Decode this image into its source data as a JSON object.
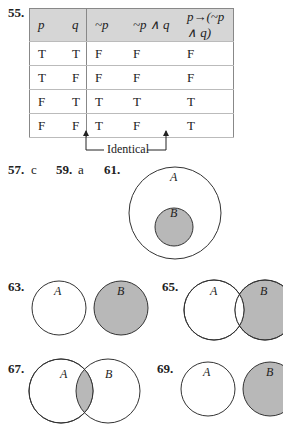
{
  "problem55": {
    "number": "55.",
    "headers": [
      "p",
      "q",
      "~p",
      "~p ∧ q",
      "p→(~p ∧ q)"
    ],
    "rows": [
      [
        "T",
        "T",
        "F",
        "F",
        "F"
      ],
      [
        "T",
        "F",
        "F",
        "F",
        "F"
      ],
      [
        "F",
        "T",
        "T",
        "T",
        "T"
      ],
      [
        "F",
        "F",
        "T",
        "F",
        "T"
      ]
    ],
    "annotation": "Identical"
  },
  "answers": [
    {
      "number": "57.",
      "value": "c"
    },
    {
      "number": "59.",
      "value": "a"
    }
  ],
  "diagrams": {
    "p61": {
      "number": "61.",
      "label_outer": "A",
      "label_inner": "B"
    },
    "p63": {
      "number": "63.",
      "label_a": "A",
      "label_b": "B"
    },
    "p65": {
      "number": "65.",
      "label_a": "A",
      "label_b": "B"
    },
    "p67": {
      "number": "67.",
      "label_a": "A",
      "label_b": "B"
    },
    "p69": {
      "number": "69.",
      "label_a": "A",
      "label_b": "B"
    }
  },
  "colors": {
    "shade": "#b8b8b8",
    "header_bg": "#d6d6d6"
  }
}
